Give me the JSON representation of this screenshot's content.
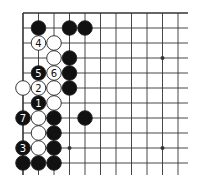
{
  "board": {
    "origin_x": 23,
    "origin_y": 13,
    "spacing_x": 15.5,
    "spacing_y": 15,
    "cols": 11,
    "rows": 11,
    "line_extend_right": 10,
    "line_extend_down": 12,
    "edges": [
      "top",
      "left"
    ],
    "line_color": "#333333",
    "stone_radius": 7.3,
    "star_points": [
      [
        9,
        3
      ],
      [
        9,
        9
      ],
      [
        3,
        9
      ]
    ]
  },
  "colors": {
    "black_stone": "#111111",
    "white_stone": "#ffffff",
    "stone_outline": "#222222",
    "number_on_black": "#ffffff",
    "number_on_white": "#111111"
  },
  "stones": [
    {
      "color": "black",
      "col": 1,
      "row": 1,
      "label": ""
    },
    {
      "color": "black",
      "col": 3,
      "row": 1,
      "label": ""
    },
    {
      "color": "black",
      "col": 4,
      "row": 1,
      "label": ""
    },
    {
      "color": "white",
      "col": 1,
      "row": 2,
      "label": "4"
    },
    {
      "color": "white",
      "col": 2,
      "row": 2,
      "label": ""
    },
    {
      "color": "white",
      "col": 2,
      "row": 3,
      "label": ""
    },
    {
      "color": "black",
      "col": 3,
      "row": 3,
      "label": ""
    },
    {
      "color": "black",
      "col": 1,
      "row": 4,
      "label": "5"
    },
    {
      "color": "white",
      "col": 2,
      "row": 4,
      "label": "6"
    },
    {
      "color": "black",
      "col": 3,
      "row": 4,
      "label": ""
    },
    {
      "color": "white",
      "col": 0,
      "row": 5,
      "label": ""
    },
    {
      "color": "white",
      "col": 1,
      "row": 5,
      "label": "2"
    },
    {
      "color": "white",
      "col": 2,
      "row": 5,
      "label": ""
    },
    {
      "color": "black",
      "col": 3,
      "row": 5,
      "label": ""
    },
    {
      "color": "black",
      "col": 1,
      "row": 6,
      "label": "1"
    },
    {
      "color": "white",
      "col": 2,
      "row": 6,
      "label": ""
    },
    {
      "color": "black",
      "col": 0,
      "row": 7,
      "label": "7"
    },
    {
      "color": "white",
      "col": 1,
      "row": 7,
      "label": ""
    },
    {
      "color": "black",
      "col": 2,
      "row": 7,
      "label": ""
    },
    {
      "color": "black",
      "col": 4,
      "row": 7,
      "label": ""
    },
    {
      "color": "white",
      "col": 1,
      "row": 8,
      "label": ""
    },
    {
      "color": "black",
      "col": 2,
      "row": 8,
      "label": ""
    },
    {
      "color": "black",
      "col": 0,
      "row": 9,
      "label": "3"
    },
    {
      "color": "white",
      "col": 1,
      "row": 9,
      "label": ""
    },
    {
      "color": "black",
      "col": 2,
      "row": 9,
      "label": ""
    },
    {
      "color": "black",
      "col": 0,
      "row": 10,
      "label": ""
    },
    {
      "color": "black",
      "col": 1,
      "row": 10,
      "label": ""
    },
    {
      "color": "black",
      "col": 2,
      "row": 10,
      "label": ""
    }
  ]
}
